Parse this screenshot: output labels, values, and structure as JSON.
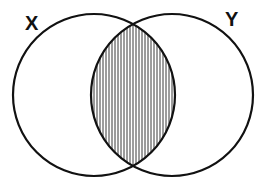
{
  "diagram": {
    "type": "venn",
    "sets": [
      {
        "label": "X",
        "cx": 94,
        "cy": 95,
        "r": 81
      },
      {
        "label": "Y",
        "cx": 172,
        "cy": 95,
        "r": 81
      }
    ],
    "shaded_region": "X ∩ Y",
    "shading": "vertical-hatch",
    "stroke_color": "#111111",
    "background": "#ffffff"
  }
}
